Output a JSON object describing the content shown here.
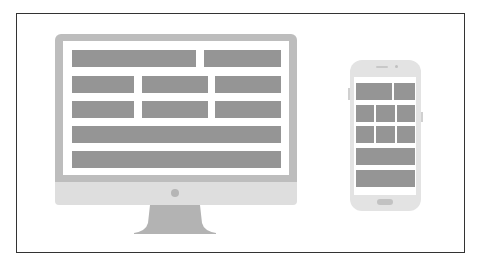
{
  "diagram": {
    "title": "",
    "colors": {
      "frame_border": "#333333",
      "monitor_bezel": "#bdbdbd",
      "monitor_chin": "#dedede",
      "content_block": "#959595",
      "phone_body": "#e3e3e3",
      "background": "#ffffff"
    },
    "devices": [
      {
        "type": "desktop-monitor",
        "rows": [
          {
            "blocks": 2,
            "layout": "wide + narrow"
          },
          {
            "blocks": 3,
            "layout": "thirds"
          },
          {
            "blocks": 3,
            "layout": "thirds"
          },
          {
            "blocks": 1,
            "layout": "full width"
          },
          {
            "blocks": 1,
            "layout": "full width"
          }
        ]
      },
      {
        "type": "smartphone",
        "rows": [
          {
            "blocks": 2,
            "layout": "wide + narrow"
          },
          {
            "blocks": 3,
            "layout": "thirds"
          },
          {
            "blocks": 3,
            "layout": "thirds"
          },
          {
            "blocks": 1,
            "layout": "full width"
          },
          {
            "blocks": 1,
            "layout": "full width"
          }
        ]
      }
    ]
  }
}
